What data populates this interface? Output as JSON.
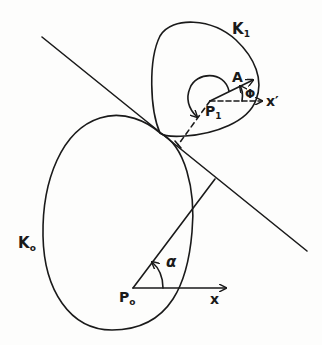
{
  "figure": {
    "labels": {
      "k0_main": "K",
      "k0_sub": "o",
      "k1_main": "K",
      "k1_sub": "1",
      "p0_main": "P",
      "p0_sub": "o",
      "p1_main": "P",
      "p1_sub": "1",
      "a": "A",
      "phi": "Φ",
      "alpha": "α",
      "x": "x",
      "x_prime": "x′"
    },
    "colors": {
      "stroke": "#1a1a1a",
      "background": "#fdfdfc"
    }
  }
}
